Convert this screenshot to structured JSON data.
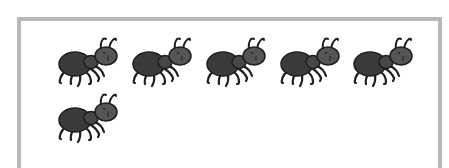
{
  "scene": {
    "description": "Counting picture: ants inside a framed box",
    "ant_count": 6,
    "rows": [
      {
        "count": 5
      },
      {
        "count": 1
      }
    ]
  },
  "colors": {
    "frame": "#b8b8b8",
    "background": "#ffffff",
    "ant_body": "#3a3a3a",
    "ant_head": "#555555",
    "ant_outline": "#1e1e1e"
  },
  "ants": [
    {
      "id": 1,
      "x": 53,
      "y": 36
    },
    {
      "id": 2,
      "x": 127,
      "y": 36
    },
    {
      "id": 3,
      "x": 201,
      "y": 36
    },
    {
      "id": 4,
      "x": 275,
      "y": 36
    },
    {
      "id": 5,
      "x": 348,
      "y": 36
    },
    {
      "id": 6,
      "x": 53,
      "y": 92
    }
  ]
}
